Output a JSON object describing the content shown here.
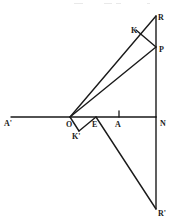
{
  "figure": {
    "canvas": {
      "width": 173,
      "height": 222
    },
    "colors": {
      "background": "#ffffff",
      "ink": "#1a1a1a",
      "faint": "#e9e9e9"
    },
    "points": [
      {
        "id": "A-prime",
        "label": "A'",
        "x": 11,
        "y": 117,
        "label_x": 4,
        "label_y": 120
      },
      {
        "id": "O",
        "label": "O",
        "x": 70,
        "y": 117,
        "label_x": 66,
        "label_y": 121
      },
      {
        "id": "K-prime",
        "label": "K'",
        "x": 79,
        "y": 131,
        "label_x": 72,
        "label_y": 133
      },
      {
        "id": "E",
        "label": "E",
        "x": 96,
        "y": 117,
        "label_x": 92,
        "label_y": 121
      },
      {
        "id": "A",
        "label": "A",
        "x": 119,
        "y": 117,
        "label_x": 115,
        "label_y": 121
      },
      {
        "id": "N",
        "label": "N",
        "x": 156,
        "y": 117,
        "label_x": 160,
        "label_y": 120
      },
      {
        "id": "K",
        "label": "K",
        "x": 136,
        "y": 30,
        "label_x": 131,
        "label_y": 27
      },
      {
        "id": "P",
        "label": "P",
        "x": 156,
        "y": 47,
        "label_x": 159,
        "label_y": 46
      },
      {
        "id": "R",
        "label": "R",
        "x": 156,
        "y": 16,
        "label_x": 158,
        "label_y": 14
      },
      {
        "id": "R-prime",
        "label": "R'",
        "x": 156,
        "y": 209,
        "label_x": 158,
        "label_y": 210
      }
    ],
    "segments": [
      {
        "id": "axis-horizontal",
        "from": "A-prime",
        "to": "N",
        "x1": 11,
        "y1": 117,
        "x2": 156,
        "y2": 117,
        "weight": 1.4
      },
      {
        "id": "vertical-R-to-N",
        "from": "R",
        "to": "N",
        "x1": 156,
        "y1": 16,
        "x2": 156,
        "y2": 117,
        "weight": 1.4
      },
      {
        "id": "vertical-N-to-Rp",
        "from": "N",
        "to": "R-prime",
        "x1": 156,
        "y1": 117,
        "x2": 156,
        "y2": 209,
        "weight": 1.4
      },
      {
        "id": "ray-O-to-R",
        "from": "O",
        "to": "R",
        "x1": 70,
        "y1": 117,
        "x2": 156,
        "y2": 16,
        "weight": 1.4
      },
      {
        "id": "ray-O-to-P",
        "from": "O",
        "to": "P",
        "x1": 70,
        "y1": 117,
        "x2": 156,
        "y2": 47,
        "weight": 1.4
      },
      {
        "id": "chord-K-to-P",
        "from": "K",
        "to": "P",
        "x1": 136,
        "y1": 30,
        "x2": 156,
        "y2": 47,
        "weight": 1.4
      },
      {
        "id": "ray-O-to-Kprime",
        "from": "O",
        "to": "K-prime",
        "x1": 70,
        "y1": 117,
        "x2": 79,
        "y2": 131,
        "weight": 1.4
      },
      {
        "id": "ray-Kprime-to-E",
        "from": "K-prime",
        "to": "E",
        "x1": 79,
        "y1": 131,
        "x2": 96,
        "y2": 117,
        "weight": 1.4
      },
      {
        "id": "ray-E-to-Rprime",
        "from": "E",
        "to": "R-prime",
        "x1": 96,
        "y1": 117,
        "x2": 156,
        "y2": 209,
        "weight": 1.4
      }
    ],
    "ticks": [
      {
        "id": "tick-at-A",
        "at": "A",
        "x": 119,
        "y1": 111,
        "y2": 117
      }
    ],
    "scan_specks": [
      {
        "id": "speck-1",
        "x": 74,
        "y": 3,
        "w": 9
      },
      {
        "id": "speck-2",
        "x": 104,
        "y": 3,
        "w": 8
      },
      {
        "id": "speck-3",
        "x": 116,
        "y": 3,
        "w": 5
      },
      {
        "id": "speck-4",
        "x": 147,
        "y": 3,
        "w": 3
      }
    ]
  }
}
